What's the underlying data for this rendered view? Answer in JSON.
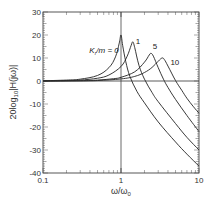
{
  "chart_data": {
    "type": "line",
    "title": "",
    "xlabel": "ω/ω0",
    "ylabel": "20log10|H(jω)|",
    "xscale": "log",
    "xlim": [
      0.1,
      10
    ],
    "ylim": [
      -40,
      30
    ],
    "xticks": [
      "0.1",
      "1",
      "10"
    ],
    "yticks": [
      "30",
      "20",
      "10",
      "0",
      "-10",
      "-20",
      "-30",
      "-40"
    ],
    "grid": false,
    "vertical_reference_line": 1,
    "series": [
      {
        "name": "Kr/m = 0",
        "label": "Kr/m = 0",
        "peak": {
          "x": 1.0,
          "y": 20
        },
        "x": [
          0.1,
          0.2,
          0.3,
          0.5,
          0.7,
          0.85,
          0.95,
          1.0,
          1.05,
          1.15,
          1.3,
          1.6,
          2,
          3,
          5,
          7,
          10
        ],
        "y": [
          0.1,
          0.4,
          0.8,
          2.4,
          5.8,
          10.5,
          16.5,
          20,
          15.5,
          8.5,
          2.0,
          -4.5,
          -9.5,
          -17.8,
          -26.5,
          -31.8,
          -37
        ]
      },
      {
        "name": "Kr/m = 1",
        "label": "1",
        "peak": {
          "x": 1.42,
          "y": 17
        },
        "x": [
          0.1,
          0.2,
          0.3,
          0.5,
          0.7,
          1.0,
          1.2,
          1.35,
          1.42,
          1.5,
          1.7,
          2,
          2.5,
          3,
          5,
          7,
          10
        ],
        "y": [
          0.0,
          0.2,
          0.4,
          1.2,
          2.6,
          6.3,
          10.8,
          15.5,
          17,
          14.5,
          6.8,
          0.8,
          -5.0,
          -9.0,
          -18.5,
          -24.5,
          -30
        ]
      },
      {
        "name": "Kr/m = 5",
        "label": "5",
        "peak": {
          "x": 2.43,
          "y": 12
        },
        "x": [
          0.1,
          0.3,
          0.5,
          0.8,
          1.0,
          1.5,
          2.0,
          2.3,
          2.43,
          2.6,
          3.0,
          3.5,
          4,
          5,
          7,
          10
        ],
        "y": [
          0.0,
          0.1,
          0.4,
          1.0,
          1.6,
          4.0,
          8.2,
          11.3,
          12,
          10.8,
          5.8,
          0.8,
          -2.8,
          -8.0,
          -15.0,
          -22
        ]
      },
      {
        "name": "Kr/m = 10",
        "label": "10",
        "peak": {
          "x": 3.36,
          "y": 10
        },
        "x": [
          0.1,
          0.3,
          0.5,
          1.0,
          1.5,
          2.0,
          2.5,
          3.0,
          3.36,
          3.6,
          4.0,
          5.0,
          6.0,
          7.0,
          8.5,
          10
        ],
        "y": [
          0.0,
          0.1,
          0.2,
          0.9,
          2.0,
          3.7,
          5.9,
          8.6,
          10,
          9.3,
          6.5,
          0.2,
          -4.0,
          -7.5,
          -11.2,
          -14
        ]
      }
    ],
    "annotations": [
      {
        "text": "Kr/m = 0",
        "x": 0.62,
        "y": 12
      },
      {
        "text": "1",
        "x": 1.55,
        "y": 16
      },
      {
        "text": "5",
        "x": 2.55,
        "y": 14
      },
      {
        "text": "10",
        "x": 4.3,
        "y": 7
      }
    ]
  }
}
